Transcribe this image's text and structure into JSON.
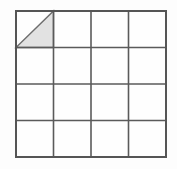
{
  "figure": {
    "canvas": {
      "width": 177,
      "height": 169,
      "background": "#fdfdfd"
    },
    "grid": {
      "rows": 4,
      "columns": 4,
      "origin_x": 16,
      "origin_y": 11,
      "cell_width": 37.5,
      "cell_height": 36.5,
      "total_width": 150,
      "total_height": 146,
      "outer_border_color": "#555555",
      "outer_border_width": 2,
      "inner_line_color": "#5a5a5a",
      "inner_line_width": 1.6,
      "cell_fill": "#fefefe"
    },
    "shaded_region": {
      "shape": "right-triangle",
      "cell_row": 1,
      "cell_column": 1,
      "half": "lower-right",
      "vertices_label": "top-right, bottom-right, bottom-left",
      "fill_color": "#e2e2e2",
      "edge_color": "#6e6e6e",
      "edge_width": 1.4,
      "area_fraction_of_cell": 0.5,
      "area_fraction_of_grid": 0.03125
    }
  },
  "chart_data": {
    "type": "heatmap",
    "xlabel": "",
    "ylabel": "",
    "columns": [
      "1",
      "2",
      "3",
      "4"
    ],
    "rows": [
      "1",
      "2",
      "3",
      "4"
    ],
    "grid": true,
    "legend": "none",
    "values": [
      [
        0.5,
        0,
        0,
        0
      ],
      [
        0,
        0,
        0,
        0
      ],
      [
        0,
        0,
        0,
        0
      ],
      [
        0,
        0,
        0,
        0
      ]
    ],
    "annotations": [
      {
        "cell": [
          1,
          1
        ],
        "text": "shaded right triangle occupying lower-right half of cell"
      }
    ]
  }
}
